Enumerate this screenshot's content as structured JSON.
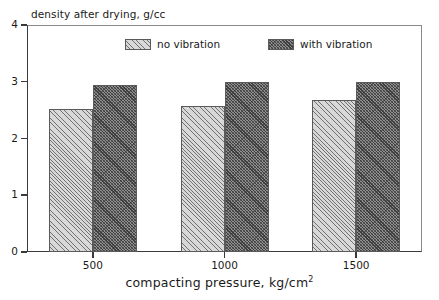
{
  "chart_data": {
    "type": "bar",
    "title": "",
    "subtitle": "",
    "xlabel": "compacting pressure, kg/cm",
    "xlabel_sup": "2",
    "ylabel": "density after drying, g/cc",
    "categories": [
      "500",
      "1000",
      "1500"
    ],
    "series": [
      {
        "name": "no vibration",
        "values": [
          2.52,
          2.58,
          2.67
        ],
        "fill": "light-hatch",
        "color": "#d8d8d8"
      },
      {
        "name": "with vibration",
        "values": [
          2.94,
          3.0,
          3.0
        ],
        "fill": "dark-hatch",
        "color": "#8f8f8f"
      }
    ],
    "ylim": [
      0,
      4
    ],
    "yticks": [
      "0",
      "1",
      "2",
      "3",
      "4"
    ],
    "ytick_values": [
      0,
      1,
      2,
      3,
      4
    ],
    "grid": false,
    "legend_position": "top-center",
    "axis_color": "#3a3a3a",
    "frame_color": "#8a8a8a",
    "background": "#ffffff"
  },
  "legend": {
    "entries": [
      {
        "label": "no vibration"
      },
      {
        "label": "with vibration"
      }
    ]
  }
}
